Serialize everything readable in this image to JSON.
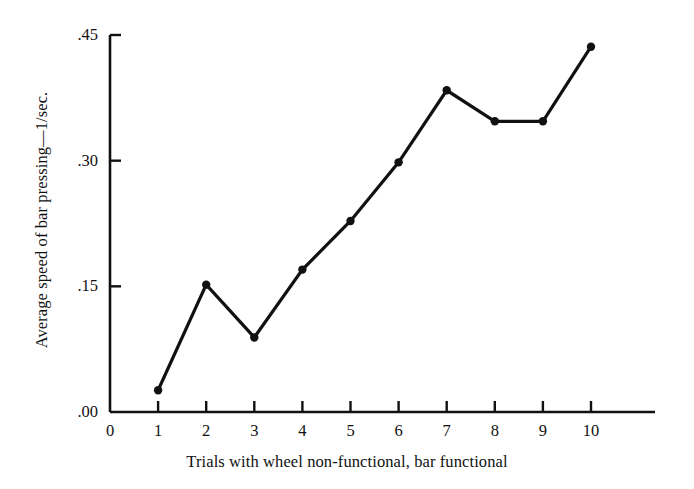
{
  "chart_data": {
    "type": "line",
    "title": "",
    "subtitle": "",
    "xlabel": "Trials with wheel non-functional, bar functional",
    "ylabel": "Average speed of bar pressing—1/sec.",
    "x": [
      1,
      2,
      3,
      4,
      5,
      6,
      7,
      8,
      9,
      10
    ],
    "values": [
      0.026,
      0.152,
      0.089,
      0.17,
      0.228,
      0.298,
      0.384,
      0.347,
      0.347,
      0.436
    ],
    "series": [
      {
        "name": "Average speed of bar pressing",
        "values": [
          0.026,
          0.152,
          0.089,
          0.17,
          0.228,
          0.298,
          0.384,
          0.347,
          0.347,
          0.436
        ]
      }
    ],
    "xlim": [
      0,
      10
    ],
    "ylim": [
      0.0,
      0.45
    ],
    "xticks": [
      0,
      1,
      2,
      3,
      4,
      5,
      6,
      7,
      8,
      9,
      10
    ],
    "xtick_labels": [
      "0",
      "1",
      "2",
      "3",
      "4",
      "5",
      "6",
      "7",
      "8",
      "9",
      "10"
    ],
    "yticks": [
      0.0,
      0.15,
      0.3,
      0.45
    ],
    "ytick_labels": [
      ".00",
      ".15",
      ".30",
      ".45"
    ],
    "grid": false,
    "legend": "none",
    "marker": "filled-circle",
    "line_color": "#111111",
    "axis_color": "#111111",
    "background_color": "#ffffff"
  }
}
